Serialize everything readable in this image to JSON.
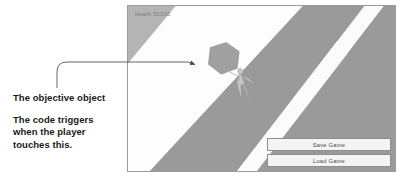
{
  "annotation": {
    "callout_1": "The objective object",
    "callout_2_line_1": "The code triggers",
    "callout_2_line_2": "when the player",
    "callout_2_line_3": "touches this.",
    "arrow_color": "#4a4a4a"
  },
  "game": {
    "hud": {
      "health_label": "Health 50/100"
    },
    "buttons": [
      {
        "label": "Save Game"
      },
      {
        "label": "Load Game"
      }
    ],
    "scene": {
      "background_color": "#fdfdfd",
      "corner_wedge_color": "#b4b4b4",
      "road_band_color": "#9a9a9a",
      "road_stripe_color": "#fbfbfb",
      "far_region_color": "#6e6e6e",
      "objective_color": "#a0a0a0",
      "objective_outline_color": "#8c8c8c",
      "player_color": "#c9c9c9",
      "objective_shape": "hexagon",
      "player_shape": "humanoid-figure"
    }
  }
}
